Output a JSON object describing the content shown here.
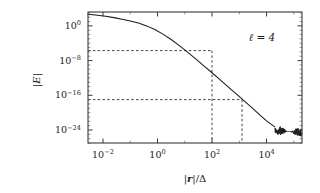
{
  "figure": {
    "background": "#ffffff",
    "frame_color": "#3a3a3a",
    "curve_color": "#1c1c1c",
    "guide_color": "#3c3c3c"
  },
  "annotation": {
    "text": "ℓ = 4"
  },
  "axis_titles": {
    "x_prefix": "|",
    "x_var": "r",
    "x_suffix": "|/Δ",
    "y_prefix": "|",
    "y_var": "E",
    "y_suffix": "|"
  },
  "xticks": [
    {
      "mantissa": "10",
      "exp": "−2",
      "value": -2
    },
    {
      "mantissa": "10",
      "exp": "0",
      "value": 0
    },
    {
      "mantissa": "10",
      "exp": "2",
      "value": 2
    },
    {
      "mantissa": "10",
      "exp": "4",
      "value": 4
    }
  ],
  "yticks": [
    {
      "mantissa": "10",
      "exp": "0",
      "value": 0
    },
    {
      "mantissa": "10",
      "exp": "−8",
      "value": -8
    },
    {
      "mantissa": "10",
      "exp": "−16",
      "value": -16
    },
    {
      "mantissa": "10",
      "exp": "−24",
      "value": -24
    }
  ],
  "chart_data": {
    "type": "line",
    "title": "",
    "xlabel": "|r|/Δ",
    "ylabel": "|E|",
    "xscale": "log",
    "yscale": "log",
    "xlim": [
      -2.55,
      5.3
    ],
    "ylim": [
      -27.0,
      3.2
    ],
    "grid": false,
    "legend": false,
    "annotations": [
      {
        "text": "ℓ = 4",
        "x": 2.55,
        "y": 0.0
      }
    ],
    "series": [
      {
        "name": "|E| error vs |r|/Δ",
        "comment": "log10(x), log10(|E|) pairs: plateau then power-law decay then noise floor",
        "x": [
          -2.55,
          -2.2,
          -1.9,
          -1.6,
          -1.3,
          -1.0,
          -0.7,
          -0.4,
          -0.1,
          0.2,
          0.5,
          0.8,
          1.1,
          1.4,
          1.7,
          2.0,
          2.3,
          2.6,
          2.9,
          3.2,
          3.5,
          3.8,
          4.0,
          4.15,
          4.3
        ],
        "y": [
          2.7,
          2.45,
          2.2,
          1.9,
          1.55,
          1.15,
          0.65,
          0.0,
          -0.85,
          -1.9,
          -3.15,
          -4.55,
          -6.05,
          -7.6,
          -9.2,
          -10.8,
          -12.45,
          -14.1,
          -15.75,
          -17.4,
          -19.1,
          -20.8,
          -21.9,
          -22.6,
          -23.3
        ]
      },
      {
        "name": "noise floor tail",
        "comment": "round-off dominated oscillatory region",
        "x_start": 4.3,
        "x_end": 5.3,
        "y_mean": -24.6,
        "y_spread": 0.9
      }
    ],
    "guides": [
      {
        "type": "h-v",
        "y": -5.7,
        "x": 2.0,
        "label": ""
      },
      {
        "type": "h-v",
        "y": -17.0,
        "x": 3.1,
        "label": ""
      }
    ]
  }
}
